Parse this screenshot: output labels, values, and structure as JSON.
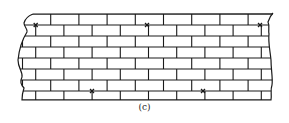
{
  "figure": {
    "caption": "(c)",
    "colors": {
      "line": "#1a1a1a",
      "background": "#ffffff"
    },
    "wall": {
      "left": 22,
      "right": 270,
      "bed_joints_y": [
        14,
        25,
        36,
        47,
        58,
        69,
        80,
        91,
        100
      ],
      "brick_length": 28.2,
      "odd_row_offset": 50.7,
      "even_row_offset": 35.7
    },
    "ties": [
      {
        "x": 35.7,
        "y": 25
      },
      {
        "x": 147,
        "y": 25
      },
      {
        "x": 260,
        "y": 25
      },
      {
        "x": 92,
        "y": 91
      },
      {
        "x": 203,
        "y": 91
      }
    ]
  }
}
